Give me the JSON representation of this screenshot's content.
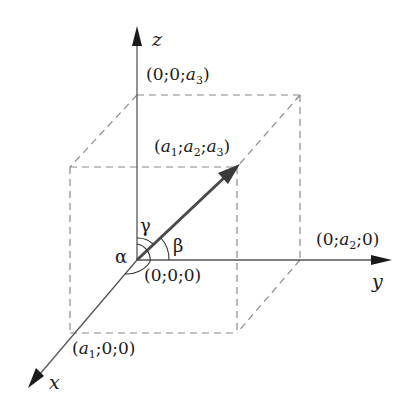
{
  "axes": {
    "x": {
      "label": "x"
    },
    "y": {
      "label": "y"
    },
    "z": {
      "label": "z"
    }
  },
  "points": {
    "origin": {
      "text": "(0;0;0)"
    },
    "z_point": {
      "open": "(0;0;",
      "var": "a",
      "sub": "3",
      "close": ")"
    },
    "y_point": {
      "open": "(0;",
      "var": "a",
      "sub": "2",
      "close": ";0)"
    },
    "x_point": {
      "open": "(",
      "var": "a",
      "sub": "1",
      "close": ";0;0)"
    },
    "vector_end": {
      "open": "(",
      "v1": "a",
      "s1": "1",
      "sep1": ";",
      "v2": "a",
      "s2": "2",
      "sep2": ";",
      "v3": "a",
      "s3": "3",
      "close": ")"
    }
  },
  "angles": {
    "alpha": "α",
    "beta": "β",
    "gamma": "γ"
  },
  "colors": {
    "axis": "#555555",
    "dashed": "#8a8a8a",
    "vector": "#4a4a4a",
    "text": "#1a1a1a"
  }
}
